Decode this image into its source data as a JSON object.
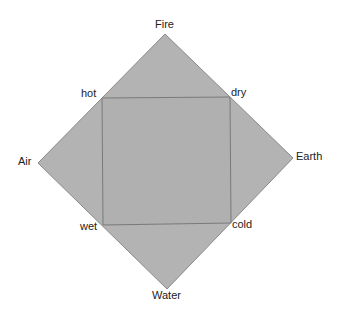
{
  "diagram": {
    "elements": {
      "top": "Fire",
      "left": "Air",
      "right": "Earth",
      "bottom": "Water"
    },
    "qualities": {
      "top_left": "hot",
      "top_right": "dry",
      "bottom_right": "cold",
      "bottom_left": "wet"
    },
    "colors": {
      "fill": "#b3b3b3",
      "stroke": "#7a7a7a"
    }
  }
}
